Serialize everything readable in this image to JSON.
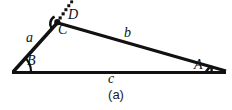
{
  "figure": {
    "caption": "(a)",
    "type": "geometry-diagram",
    "colors": {
      "stroke": "#111111",
      "background": "#ffffff",
      "text": "#111111"
    },
    "vertices": [
      {
        "id": "B",
        "label": "B",
        "x": 12,
        "y": 72
      },
      {
        "id": "C",
        "label": "C",
        "x": 57,
        "y": 22
      },
      {
        "id": "A",
        "label": "A",
        "x": 225,
        "y": 72
      }
    ],
    "sides": [
      {
        "id": "a",
        "label": "a",
        "from": "B",
        "to": "C"
      },
      {
        "id": "b",
        "label": "b",
        "from": "C",
        "to": "A"
      },
      {
        "id": "c",
        "label": "c",
        "from": "B",
        "to": "A"
      }
    ],
    "angles": [
      {
        "id": "B",
        "label": "B",
        "at": "B",
        "marker": "arc"
      },
      {
        "id": "A",
        "label": "A",
        "at": "A",
        "marker": "arc"
      },
      {
        "id": "C",
        "label": "C",
        "at": "C",
        "marker": "arc"
      }
    ],
    "extension": {
      "id": "D",
      "label": "D",
      "style": "dotted",
      "from": "C",
      "to_x": 73,
      "to_y": 2
    }
  }
}
